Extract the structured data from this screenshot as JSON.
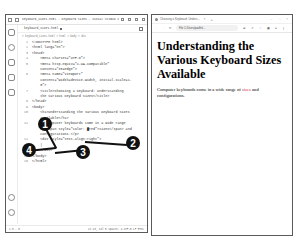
{
  "vscode": {
    "title": "keyboard_sizes.html - Keyboard Sizes - Visual Studio Code",
    "tab": "keyboard_sizes.html",
    "breadcrumb": "> keyboard_sizes.html > html > body > div",
    "lines": [
      {
        "n": "1",
        "t": "<!DOCTYPE html>"
      },
      {
        "n": "2",
        "t": "<html lang=\"en\">"
      },
      {
        "n": "3",
        "t": "<head>"
      },
      {
        "n": "4",
        "t": "    <meta charset=\"UTF-8\">"
      },
      {
        "n": "5",
        "t": "    <meta http-equiv=\"X-UA-Compatible\""
      },
      {
        "n": "",
        "t": "    content=\"IE=edge\">"
      },
      {
        "n": "6",
        "t": "    <meta name=\"viewport\""
      },
      {
        "n": "",
        "t": "    content=\"width=device-width, initial-scale=1."
      },
      {
        "n": "",
        "t": "    0\">"
      },
      {
        "n": "7",
        "t": "    <title>Choosing a Keyboard: Understanding"
      },
      {
        "n": "",
        "t": "    the Various Keyboard Sizes</title>"
      },
      {
        "n": "8",
        "t": "</head>"
      },
      {
        "n": "9",
        "t": "<body>"
      },
      {
        "n": "10",
        "t": "    <h1>Understanding the Various Keyboard Sizes"
      },
      {
        "n": "",
        "t": "    Available</h1>"
      },
      {
        "n": "11",
        "t": "    <p>Computer keyboards come in a wide range"
      },
      {
        "n": "",
        "t": "    of <span style=\"color: ▇red\">sizes</span> and"
      },
      {
        "n": "",
        "t": "    configurations.</p>"
      },
      {
        "n": "12",
        "t": "    <div style=\"text-align:right\">"
      },
      {
        "n": "13",
        "t": "    |"
      },
      {
        "n": "14",
        "t": "    </div>"
      },
      {
        "n": "15",
        "t": "</body>"
      },
      {
        "n": "16",
        "t": "</html>"
      }
    ],
    "status_left": "⊗ 0 ⚠ 0",
    "status_right": "Ln 13, Col 5  Spaces: 4  UTF-8  LF  HTML"
  },
  "browser": {
    "tab_title": "Choosing a Keyboard: Unders...",
    "url": "File  C:/Users/paulfin/...",
    "heading": "Understanding the Various Keyboard Sizes Available",
    "para_before": "Computer keyboards come in a wide range of ",
    "para_accent": "sizes",
    "para_after": " and configurations.",
    "accent_color": "#cc3333"
  },
  "callouts": [
    "1",
    "2",
    "3",
    "4"
  ]
}
